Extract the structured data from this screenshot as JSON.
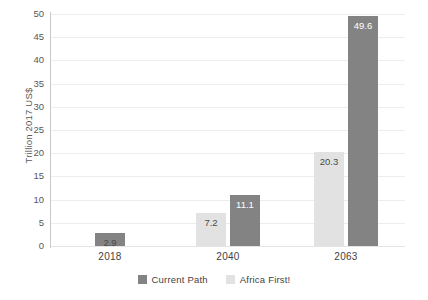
{
  "chart_data": {
    "type": "bar",
    "title": "",
    "subtitle": "",
    "xlabel": "",
    "ylabel": "Trillion 2017 US$",
    "ylim": [
      0,
      50
    ],
    "yticks": [
      0,
      5,
      10,
      15,
      20,
      25,
      30,
      35,
      40,
      45,
      50
    ],
    "grid": true,
    "legend_position": "bottom-center",
    "categories": [
      "2018",
      "2040",
      "2063"
    ],
    "series": [
      {
        "name": "Africa First!",
        "color": "#e2e2e2",
        "values": [
          null,
          7.2,
          20.3
        ],
        "labels": [
          "",
          "7.2",
          "20.3"
        ]
      },
      {
        "name": "Current Path",
        "color": "#838383",
        "values": [
          2.9,
          11.1,
          49.6
        ],
        "labels": [
          "2.9",
          "11.1",
          "49.6"
        ]
      }
    ],
    "legend": [
      {
        "label": "Current Path",
        "color": "#838383"
      },
      {
        "label": "Africa First!",
        "color": "#e2e2e2"
      }
    ],
    "bars": [
      {
        "category": "2018",
        "series": "Current Path",
        "value": 2.9,
        "label": "2.9",
        "color": "#838383",
        "label_color": "#4a4a4a"
      },
      {
        "category": "2040",
        "series": "Africa First!",
        "value": 7.2,
        "label": "7.2",
        "color": "#e2e2e2",
        "label_color": "#4a4a4a"
      },
      {
        "category": "2040",
        "series": "Current Path",
        "value": 11.1,
        "label": "11.1",
        "color": "#838383",
        "label_color": "#ffffff"
      },
      {
        "category": "2063",
        "series": "Africa First!",
        "value": 20.3,
        "label": "20.3",
        "color": "#e2e2e2",
        "label_color": "#4a4a4a"
      },
      {
        "category": "2063",
        "series": "Current Path",
        "value": 49.6,
        "label": "49.6",
        "color": "#838383",
        "label_color": "#ffffff"
      }
    ],
    "colors": {
      "gridline": "#ededed",
      "axis_line": "#c9c9c9",
      "text": "#3f3f3f",
      "tick_text": "#58585a",
      "background": "#ffffff"
    }
  }
}
